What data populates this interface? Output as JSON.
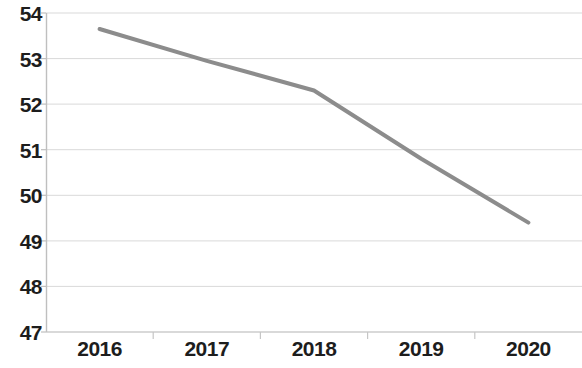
{
  "chart_data": {
    "type": "line",
    "title": "",
    "subtitle": "",
    "xlabel": "",
    "ylabel": "",
    "categories": [
      "2016",
      "2017",
      "2018",
      "2019",
      "2020"
    ],
    "values": [
      53.65,
      52.95,
      52.3,
      50.8,
      49.4
    ],
    "series": [
      {
        "name": "",
        "values": [
          53.65,
          52.95,
          52.3,
          50.8,
          49.4
        ],
        "color": "#8c8c8c"
      }
    ],
    "ylim": [
      47,
      54
    ],
    "ytick_labels": [
      "47",
      "48",
      "49",
      "50",
      "51",
      "52",
      "53",
      "54"
    ],
    "ytick_values": [
      47,
      48,
      49,
      50,
      51,
      52,
      53,
      54
    ],
    "xtick_labels": [
      "2016",
      "2017",
      "2018",
      "2019",
      "2020"
    ],
    "grid": true,
    "grid_axis": "y",
    "grid_color": "#d9d9d9",
    "axis_color": "#bfbfbf",
    "legend": false,
    "legend_position": "none",
    "markers": false,
    "line_width": 4,
    "background": "#ffffff",
    "annotations": []
  }
}
